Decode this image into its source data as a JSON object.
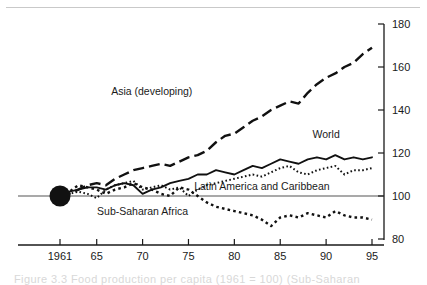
{
  "figure": {
    "caption_partial": "Figure 3.3   Food production per capita (1961 = 100) (Sub-Saharan"
  },
  "chart_data": {
    "type": "line",
    "title": "",
    "subtitle": "",
    "xlabel": "",
    "ylabel": "",
    "xlim": [
      1961,
      1995
    ],
    "ylim": [
      80,
      180
    ],
    "grid": false,
    "legend_position": "inline-annotations",
    "baseline": 100,
    "baseline_marker": {
      "x": 1961,
      "y": 100,
      "shape": "filled-circle"
    },
    "xticks": [
      1961,
      65,
      70,
      75,
      80,
      85,
      90,
      95
    ],
    "xtick_labels": [
      "1961",
      "65",
      "70",
      "75",
      "80",
      "85",
      "90",
      "95"
    ],
    "yticks": [
      80,
      100,
      120,
      140,
      160,
      180
    ],
    "ytick_labels": [
      "80",
      "100",
      "120",
      "140",
      "160",
      "180"
    ],
    "x": [
      1961,
      1962,
      1963,
      1964,
      1965,
      1966,
      1967,
      1968,
      1969,
      1970,
      1971,
      1972,
      1973,
      1974,
      1975,
      1976,
      1977,
      1978,
      1979,
      1980,
      1981,
      1982,
      1983,
      1984,
      1985,
      1986,
      1987,
      1988,
      1989,
      1990,
      1991,
      1992,
      1993,
      1994,
      1995
    ],
    "series": [
      {
        "name": "Asia (developing)",
        "style": "long-dash",
        "label_x": 1971,
        "label_y": 147,
        "values": [
          100,
          101,
          103,
          105,
          106,
          105,
          108,
          110,
          112,
          113,
          114,
          115,
          114,
          116,
          118,
          119,
          121,
          125,
          128,
          129,
          132,
          135,
          137,
          140,
          142,
          144,
          143,
          148,
          152,
          155,
          157,
          160,
          162,
          166,
          169
        ]
      },
      {
        "name": "World",
        "style": "solid",
        "label_x": 1990,
        "label_y": 127,
        "values": [
          100,
          102,
          103,
          104,
          104,
          103,
          105,
          106,
          105,
          101,
          103,
          104,
          106,
          107,
          108,
          110,
          110,
          112,
          111,
          110,
          112,
          114,
          113,
          115,
          117,
          116,
          115,
          117,
          118,
          117,
          119,
          117,
          118,
          117,
          118
        ]
      },
      {
        "name": "Latin America and Caribbean",
        "style": "fine-dot",
        "label_x": 1983,
        "label_y": 103,
        "values": [
          100,
          101,
          102,
          101,
          99,
          103,
          105,
          106,
          107,
          103,
          104,
          105,
          103,
          104,
          100,
          103,
          105,
          106,
          107,
          108,
          109,
          110,
          109,
          111,
          113,
          114,
          111,
          110,
          112,
          113,
          114,
          110,
          112,
          112,
          113
        ]
      },
      {
        "name": "Sub-Saharan Africa",
        "style": "coarse-dot",
        "label_x": 1970,
        "label_y": 91,
        "values": [
          100,
          102,
          105,
          104,
          103,
          101,
          103,
          104,
          106,
          104,
          103,
          101,
          100,
          104,
          103,
          100,
          97,
          95,
          94,
          93,
          92,
          91,
          89,
          86,
          90,
          91,
          90,
          92,
          91,
          90,
          93,
          91,
          90,
          90,
          89
        ]
      }
    ]
  }
}
